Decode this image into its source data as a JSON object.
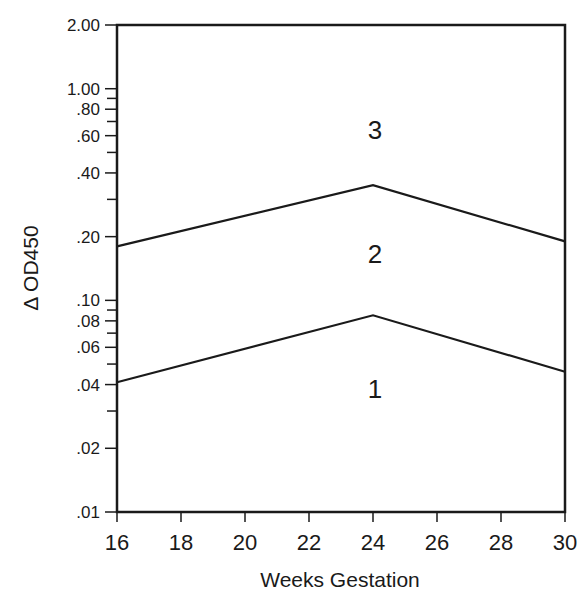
{
  "chart_data": {
    "type": "line",
    "title": "",
    "xlabel": "Weeks Gestation",
    "ylabel": "Δ OD450",
    "yscale": "log",
    "xlim": [
      16,
      30
    ],
    "ylim": [
      0.01,
      2.0
    ],
    "grid": false,
    "legend": "none",
    "x_ticks": [
      "16",
      "18",
      "20",
      "22",
      "24",
      "26",
      "28",
      "30"
    ],
    "y_ticks": [
      {
        "value": 2.0,
        "label": "2.00"
      },
      {
        "value": 1.0,
        "label": "1.00"
      },
      {
        "value": 0.8,
        "label": ".80"
      },
      {
        "value": 0.6,
        "label": ".60"
      },
      {
        "value": 0.4,
        "label": ".40"
      },
      {
        "value": 0.2,
        "label": ".20"
      },
      {
        "value": 0.1,
        "label": ".10"
      },
      {
        "value": 0.08,
        "label": ".08"
      },
      {
        "value": 0.06,
        "label": ".06"
      },
      {
        "value": 0.04,
        "label": ".04"
      },
      {
        "value": 0.02,
        "label": ".02"
      },
      {
        "value": 0.01,
        "label": ".01"
      }
    ],
    "series": [
      {
        "name": "Upper boundary (zone 2/3)",
        "x": [
          16,
          24,
          30
        ],
        "values": [
          0.18,
          0.35,
          0.19
        ]
      },
      {
        "name": "Lower boundary (zone 1/2)",
        "x": [
          16,
          24,
          30
        ],
        "values": [
          0.041,
          0.085,
          0.046
        ]
      }
    ],
    "annotations": [
      {
        "text": "3",
        "x": 24,
        "y": 0.6,
        "meaning": "Zone 3"
      },
      {
        "text": "2",
        "x": 24,
        "y": 0.17,
        "meaning": "Zone 2"
      },
      {
        "text": "1",
        "x": 24,
        "y": 0.035,
        "meaning": "Zone 1"
      }
    ]
  },
  "labels": {
    "xlabel": "Weeks Gestation",
    "ylabel": "Δ OD450",
    "zone3": "3",
    "zone2": "2",
    "zone1": "1"
  }
}
